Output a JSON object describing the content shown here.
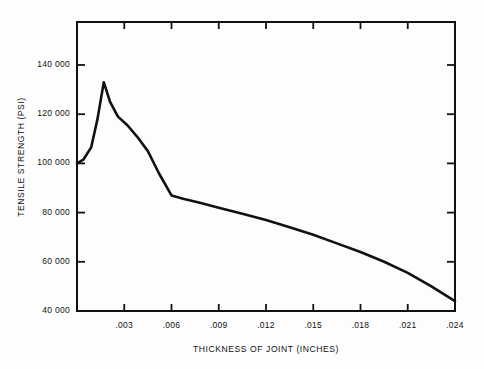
{
  "chart_data": {
    "type": "line",
    "title": "",
    "xlabel": "THICKNESS OF JOINT (INCHES)",
    "ylabel": "TENSILE STRENGTH (PSI)",
    "xlim": [
      0,
      0.024
    ],
    "ylim": [
      40000,
      158000
    ],
    "grid": false,
    "legend": null,
    "xticks": [
      0.003,
      0.006,
      0.009,
      0.012,
      0.015,
      0.018,
      0.021,
      0.024
    ],
    "xtick_labels": [
      ".003",
      ".006",
      ".009",
      ".012",
      ".015",
      ".018",
      ".021",
      ".024"
    ],
    "yticks": [
      40000,
      60000,
      80000,
      100000,
      120000,
      140000
    ],
    "ytick_labels": [
      "40 000",
      "60 000",
      "80 000",
      "100 000",
      "120 000",
      "140 000"
    ],
    "line_color": "#111111",
    "line_width": 2.6,
    "series": [
      {
        "name": "Tensile strength vs joint thickness",
        "x": [
          0.0,
          0.0004,
          0.0009,
          0.0013,
          0.0017,
          0.0021,
          0.0026,
          0.0032,
          0.0038,
          0.0045,
          0.0052,
          0.006,
          0.0068,
          0.0078,
          0.009,
          0.0105,
          0.012,
          0.0135,
          0.015,
          0.0165,
          0.018,
          0.0195,
          0.021,
          0.0225,
          0.024
        ],
        "y": [
          100000,
          101500,
          106500,
          118000,
          133000,
          125000,
          119000,
          115500,
          111000,
          105000,
          96000,
          87000,
          85500,
          84000,
          82000,
          79500,
          77000,
          74000,
          71000,
          67500,
          64000,
          60000,
          55500,
          50000,
          44000
        ]
      }
    ],
    "annotations": []
  },
  "axes": {
    "frame_color": "#111111",
    "tick_color": "#111111"
  }
}
